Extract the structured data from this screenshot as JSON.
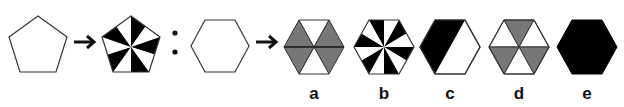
{
  "puzzle": {
    "type": "figure-analogy",
    "colors": {
      "stroke": "#333333",
      "black": "#000000",
      "gray": "#777777",
      "white": "#ffffff"
    },
    "premise": {
      "source": {
        "shape": "pentagon",
        "fill": "empty"
      },
      "relation_symbol": "arrow-right",
      "target": {
        "shape": "pentagon",
        "fill": "pinwheel-10-alternating-black-white"
      }
    },
    "separator": ":",
    "question": {
      "source": {
        "shape": "hexagon",
        "fill": "empty"
      },
      "relation_symbol": "arrow-right"
    },
    "options": [
      {
        "label": "a",
        "description": "hexagon split into 6 triangles by horizontal line; 4 side triangles gray, top and bottom white"
      },
      {
        "label": "b",
        "description": "hexagon pinwheel with 12 alternating black-white wedges"
      },
      {
        "label": "c",
        "description": "hexagon split diagonally; left half black, right half white"
      },
      {
        "label": "d",
        "description": "hexagon split into 6 triangles; alternating gray and white"
      },
      {
        "label": "e",
        "description": "solid black hexagon"
      }
    ]
  }
}
